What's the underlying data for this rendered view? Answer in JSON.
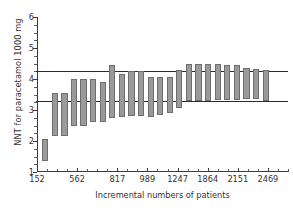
{
  "chart_data": {
    "type": "bar",
    "title": "",
    "xlabel": "Incremental numbers of patients",
    "ylabel": "NNT for paracetamol 1000 mg",
    "ylim": [
      1,
      6
    ],
    "yticks": [
      1,
      2,
      3,
      4,
      5,
      6
    ],
    "ytick_labels": [
      "1",
      "2",
      "3",
      "4",
      "5",
      "6"
    ],
    "yminor_step": 0.25,
    "grid": false,
    "legend": null,
    "xtick_labels": [
      "152",
      "562",
      "817",
      "989",
      "1247",
      "1864",
      "2151",
      "2469"
    ],
    "xtick_label_indices": [
      0,
      4,
      8,
      11,
      14,
      17,
      20,
      23
    ],
    "n_xticks": 26,
    "bar_color": "#9a9a9a",
    "bar_edge_color": "#6e6e6e",
    "reference_lines": [
      {
        "name": "upper-confidence-limit",
        "value": 4.25,
        "color": "#2b2b2b"
      },
      {
        "name": "lower-confidence-limit",
        "value": 3.3,
        "color": "#2b2b2b"
      }
    ],
    "series_note": "Each bar spans the 95% confidence interval of the cumulative NNT",
    "bars": [
      {
        "low": 1.35,
        "high": 2.05
      },
      {
        "low": 2.15,
        "high": 3.55
      },
      {
        "low": 2.15,
        "high": 3.55
      },
      {
        "low": 2.5,
        "high": 4.0
      },
      {
        "low": 2.5,
        "high": 4.0
      },
      {
        "low": 2.6,
        "high": 4.0
      },
      {
        "low": 2.62,
        "high": 3.9
      },
      {
        "low": 2.75,
        "high": 4.45
      },
      {
        "low": 2.78,
        "high": 4.15
      },
      {
        "low": 2.8,
        "high": 4.25
      },
      {
        "low": 2.8,
        "high": 4.25
      },
      {
        "low": 2.78,
        "high": 4.05
      },
      {
        "low": 2.85,
        "high": 4.08
      },
      {
        "low": 2.9,
        "high": 4.05
      },
      {
        "low": 3.05,
        "high": 4.3
      },
      {
        "low": 3.3,
        "high": 4.5
      },
      {
        "low": 3.3,
        "high": 4.48
      },
      {
        "low": 3.3,
        "high": 4.48
      },
      {
        "low": 3.32,
        "high": 4.48
      },
      {
        "low": 3.32,
        "high": 4.45
      },
      {
        "low": 3.32,
        "high": 4.45
      },
      {
        "low": 3.35,
        "high": 4.35
      },
      {
        "low": 3.35,
        "high": 4.32
      },
      {
        "low": 3.3,
        "high": 4.3
      }
    ]
  }
}
